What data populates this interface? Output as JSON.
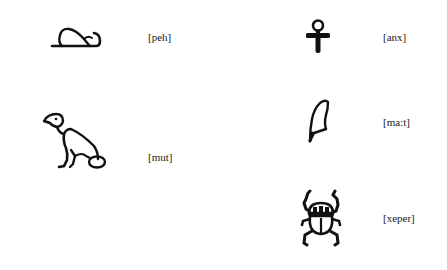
{
  "hieroglyphs": [
    {
      "id": "peh",
      "icon": "lion-hindquarters-icon",
      "transliteration": "[peh]"
    },
    {
      "id": "mut",
      "icon": "vulture-icon",
      "transliteration": "[mut]"
    },
    {
      "id": "anx",
      "icon": "ankh-icon",
      "transliteration": "[anx]"
    },
    {
      "id": "ma:t",
      "icon": "feather-icon",
      "transliteration": "[ma:t]"
    },
    {
      "id": "xeper",
      "icon": "scarab-icon",
      "transliteration": "[xeper]"
    }
  ],
  "colors": {
    "ink": "#111111",
    "background": "#ffffff"
  }
}
